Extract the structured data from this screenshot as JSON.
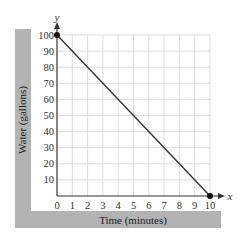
{
  "chart_data": {
    "type": "line",
    "title": "",
    "xlabel": "Time (minutes)",
    "ylabel": "Water (gallons)",
    "x_axis_var": "x",
    "y_axis_var": "y",
    "xlim": [
      0,
      10
    ],
    "ylim": [
      0,
      100
    ],
    "x_ticks": [
      0,
      1,
      2,
      3,
      4,
      5,
      6,
      7,
      8,
      9,
      10
    ],
    "y_ticks": [
      10,
      20,
      30,
      40,
      50,
      60,
      70,
      80,
      90,
      100
    ],
    "grid": true,
    "legend": null,
    "series": [
      {
        "name": "Water remaining",
        "x": [
          0,
          10
        ],
        "y": [
          100,
          0
        ],
        "marker_points": [
          [
            0,
            100
          ],
          [
            10,
            0
          ]
        ],
        "color": "#333333"
      }
    ]
  },
  "colors": {
    "frame": "#b3b3b3",
    "grid": "#dddddd",
    "axis": "#333333",
    "line": "#333333"
  }
}
